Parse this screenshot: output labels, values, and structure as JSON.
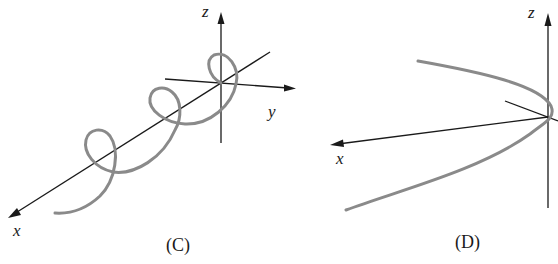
{
  "figure": {
    "panels": [
      {
        "id": "C",
        "caption": "(C)",
        "description": "Helix wound around the x-axis",
        "axis_labels": {
          "x": "x",
          "y": "y",
          "z": "z"
        },
        "curve_type": "helix"
      },
      {
        "id": "D",
        "caption": "(D)",
        "description": "Parabola-shaped curve opening toward the x-axis",
        "axis_labels": {
          "x": "x",
          "z": "z"
        },
        "curve_type": "parabola"
      }
    ],
    "colors": {
      "axis": "#1a1a1a",
      "curve": "#8a8a8a",
      "background": "#ffffff"
    }
  }
}
